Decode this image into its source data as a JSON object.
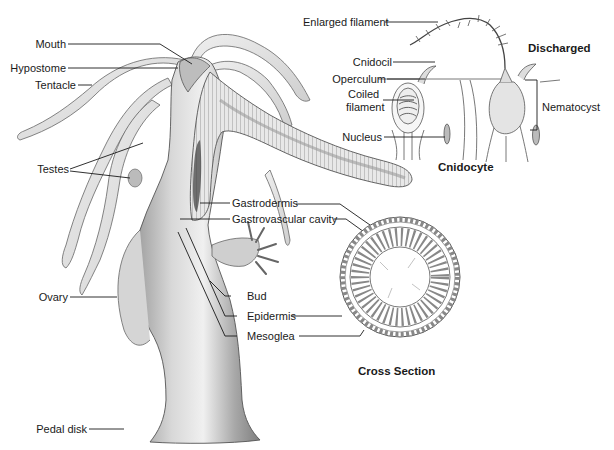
{
  "hydra": {
    "labels": {
      "mouth": "Mouth",
      "hypostome": "Hypostome",
      "tentacle": "Tentacle",
      "testes": "Testes",
      "ovary": "Ovary",
      "pedal_disk": "Pedal disk",
      "gastrodermis": "Gastrodermis",
      "gastrovascular_cavity": "Gastrovascular cavity",
      "bud": "Bud",
      "epidermis": "Epidermis",
      "mesoglea": "Mesoglea"
    }
  },
  "cnidocyte_inset": {
    "title": "Cnidocyte",
    "discharged_title": "Discharged",
    "labels": {
      "enlarged_filament": "Enlarged filament",
      "cnidocil": "Cnidocil",
      "operculum": "Operculum",
      "coiled_filament_line1": "Coiled",
      "coiled_filament_line2": "filament",
      "nucleus": "Nucleus",
      "nematocyst": "Nematocyst"
    }
  },
  "cross_section": {
    "title": "Cross Section"
  },
  "colors": {
    "line": "#1a1a1a",
    "body_fill": "#c9c9c9",
    "body_dark": "#8a8a8a",
    "tentacle_fill": "#e4e4e4",
    "outline": "#555555"
  }
}
